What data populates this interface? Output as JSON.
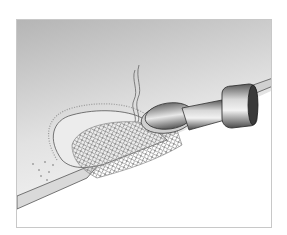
{
  "figure": {
    "colors": {
      "background_top": "#b9b9b9",
      "background_bottom": "#f4f4f4",
      "frame_border": "#c8c8c8",
      "metal_dark": "#3a3a3a",
      "metal_light": "#e6e6e6",
      "mesh": "#8a8a8a"
    }
  }
}
